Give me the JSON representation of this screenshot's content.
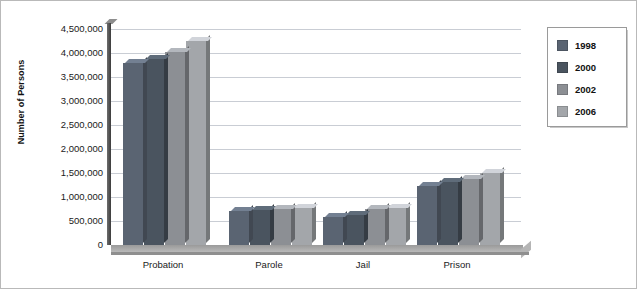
{
  "chart_data": {
    "type": "bar",
    "title": "",
    "subtitle": "",
    "xlabel": "",
    "ylabel": "Number of Persons",
    "categories": [
      "Probation",
      "Parole",
      "Jail",
      "Prison"
    ],
    "ylim": [
      0,
      4500000
    ],
    "ytick_labels": [
      "4,500,000",
      "4,000,000",
      "3,500,000",
      "3,000,000",
      "2,500,000",
      "2,000,000",
      "1,500,000",
      "1,000,000",
      "500,000",
      "0"
    ],
    "ytick_values": [
      4500000,
      4000000,
      3500000,
      3000000,
      2500000,
      2000000,
      1500000,
      1000000,
      500000,
      0
    ],
    "grid": true,
    "legend_position": "right",
    "style": "3d-grouped-columns",
    "series": [
      {
        "name": "1998",
        "color": "#5a6472",
        "values": [
          3790000,
          700000,
          590000,
          1230000
        ]
      },
      {
        "name": "2000",
        "color": "#4a545f",
        "values": [
          3880000,
          720000,
          620000,
          1320000
        ]
      },
      {
        "name": "2002",
        "color": "#8c8f94",
        "values": [
          4020000,
          750000,
          740000,
          1380000
        ]
      },
      {
        "name": "2006",
        "color": "#a3a6aa",
        "values": [
          4240000,
          780000,
          770000,
          1500000
        ]
      }
    ]
  },
  "legend": {
    "entries": [
      {
        "label": "1998",
        "color": "#5a6472"
      },
      {
        "label": "2000",
        "color": "#4a545f"
      },
      {
        "label": "2002",
        "color": "#8c8f94"
      },
      {
        "label": "2006",
        "color": "#a3a6aa"
      }
    ]
  }
}
